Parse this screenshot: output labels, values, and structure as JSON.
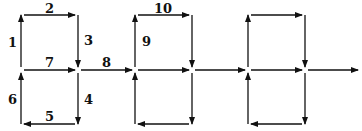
{
  "diagram": {
    "type": "directed-graph",
    "nodes": {
      "x": [
        21,
        78,
        135,
        192,
        248,
        305
      ],
      "y_top": 15,
      "y_mid": 70,
      "y_bottom": 124,
      "end_x": 358
    },
    "edge_labels": [
      {
        "id": "1",
        "text": "1",
        "x": 8,
        "y": 47
      },
      {
        "id": "2",
        "text": "2",
        "x": 45,
        "y": 13
      },
      {
        "id": "3",
        "text": "3",
        "x": 84,
        "y": 45
      },
      {
        "id": "4",
        "text": "4",
        "x": 84,
        "y": 104
      },
      {
        "id": "5",
        "text": "5",
        "x": 45,
        "y": 121
      },
      {
        "id": "6",
        "text": "6",
        "x": 8,
        "y": 104
      },
      {
        "id": "7",
        "text": "7",
        "x": 45,
        "y": 67
      },
      {
        "id": "8",
        "text": "8",
        "x": 102,
        "y": 67
      },
      {
        "id": "9",
        "text": "9",
        "x": 142,
        "y": 46
      },
      {
        "id": "10",
        "text": "10",
        "x": 154,
        "y": 13
      }
    ],
    "color": "#111111"
  }
}
